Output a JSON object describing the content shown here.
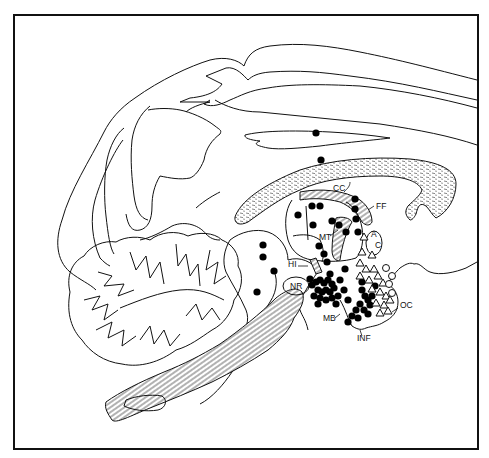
{
  "figure": {
    "type": "sagittal brain section line drawing",
    "labels": [
      {
        "id": "CC",
        "text": "CC",
        "x": 333,
        "y": 191
      },
      {
        "id": "FF",
        "text": "FF",
        "x": 376,
        "y": 209
      },
      {
        "id": "MT",
        "text": "MT",
        "x": 319,
        "y": 240
      },
      {
        "id": "AC_A",
        "text": "A",
        "x": 371,
        "y": 237
      },
      {
        "id": "AC_C",
        "text": "C",
        "x": 375,
        "y": 248
      },
      {
        "id": "HI",
        "text": "HI",
        "x": 288,
        "y": 267
      },
      {
        "id": "NR",
        "text": "NR",
        "x": 290,
        "y": 289
      },
      {
        "id": "MB",
        "text": "MB",
        "x": 323,
        "y": 321
      },
      {
        "id": "INF",
        "text": "INF",
        "x": 357,
        "y": 341
      },
      {
        "id": "OC",
        "text": "OC",
        "x": 400,
        "y": 308
      }
    ],
    "markers": {
      "filled_circles": [
        [
          316,
          133
        ],
        [
          321,
          160
        ],
        [
          355,
          199
        ],
        [
          355,
          209
        ],
        [
          312,
          206
        ],
        [
          320,
          206
        ],
        [
          298,
          215
        ],
        [
          313,
          225
        ],
        [
          332,
          221
        ],
        [
          319,
          246
        ],
        [
          339,
          225
        ],
        [
          356,
          219
        ],
        [
          358,
          232
        ],
        [
          346,
          232
        ],
        [
          263,
          245
        ],
        [
          263,
          257
        ],
        [
          274,
          271
        ],
        [
          257,
          292
        ],
        [
          324,
          254
        ],
        [
          327,
          262
        ],
        [
          345,
          269
        ],
        [
          312,
          285
        ],
        [
          316,
          282
        ],
        [
          320,
          280
        ],
        [
          324,
          283
        ],
        [
          328,
          280
        ],
        [
          332,
          284
        ],
        [
          318,
          290
        ],
        [
          322,
          292
        ],
        [
          326,
          290
        ],
        [
          330,
          292
        ],
        [
          334,
          288
        ],
        [
          314,
          296
        ],
        [
          320,
          298
        ],
        [
          326,
          300
        ],
        [
          332,
          298
        ],
        [
          338,
          296
        ],
        [
          318,
          304
        ],
        [
          336,
          304
        ],
        [
          344,
          290
        ],
        [
          348,
          300
        ],
        [
          310,
          279
        ],
        [
          330,
          274
        ],
        [
          340,
          280
        ],
        [
          362,
          290
        ],
        [
          365,
          296
        ],
        [
          368,
          300
        ],
        [
          360,
          304
        ],
        [
          364,
          310
        ],
        [
          370,
          305
        ],
        [
          356,
          310
        ],
        [
          352,
          316
        ],
        [
          348,
          322
        ],
        [
          358,
          318
        ],
        [
          368,
          314
        ],
        [
          372,
          296
        ],
        [
          375,
          286
        ],
        [
          362,
          282
        ]
      ],
      "open_triangles": [
        [
          364,
          237
        ],
        [
          362,
          252
        ],
        [
          372,
          255
        ],
        [
          360,
          263
        ],
        [
          366,
          269
        ],
        [
          374,
          269
        ],
        [
          360,
          276
        ],
        [
          369,
          280
        ],
        [
          378,
          276
        ],
        [
          383,
          283
        ],
        [
          372,
          289
        ],
        [
          380,
          292
        ],
        [
          386,
          296
        ],
        [
          376,
          303
        ],
        [
          384,
          305
        ],
        [
          390,
          300
        ],
        [
          380,
          313
        ],
        [
          388,
          311
        ]
      ],
      "open_circles": [
        [
          386,
          268
        ],
        [
          392,
          276
        ],
        [
          389,
          284
        ],
        [
          392,
          293
        ]
      ]
    }
  }
}
